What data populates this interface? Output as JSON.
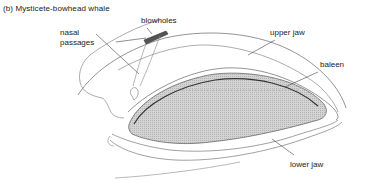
{
  "figure": {
    "title": "(b)  Mysticete-bowhead whale"
  },
  "labels": {
    "blowholes": "blowholes",
    "nasal_line1": "nasal",
    "nasal_line2": "passages",
    "upper_jaw": "upper jaw",
    "baleen": "baleen",
    "lower_jaw": "lower jaw"
  },
  "colors": {
    "line": "#6a6a6a",
    "baleen_fill": "#c8c8c8"
  }
}
